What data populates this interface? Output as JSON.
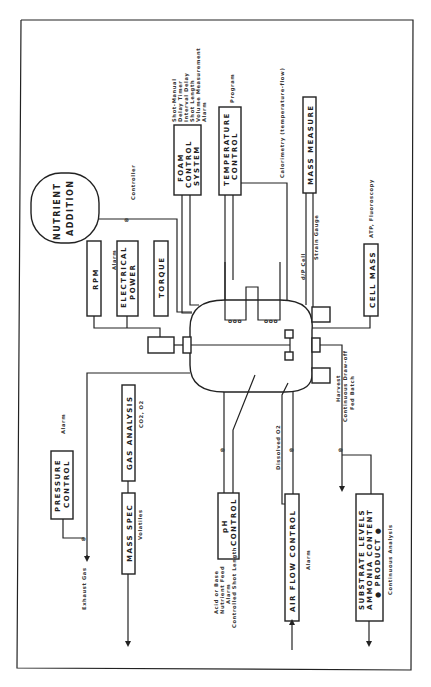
{
  "diagram": {
    "orientation": "rotated 90deg counter-clockwise",
    "blocks": {
      "nutrient": {
        "line1": "NUTRIENT",
        "line2": "ADDITION"
      },
      "foam": {
        "line1": "FOAM",
        "line2": "CONTROL",
        "line3": "SYSTEM"
      },
      "temperature": {
        "line1": "TEMPERATURE",
        "line2": "CONTROL"
      },
      "mass_measure": {
        "line1": "MASS MEASURE"
      },
      "rpm": {
        "line1": "RPM"
      },
      "electrical": {
        "line1": "ELECTRICAL",
        "line2": "POWER"
      },
      "torque": {
        "line1": "TORQUE"
      },
      "cell_mass": {
        "line1": "CELL MASS"
      },
      "pressure": {
        "line1": "PRESSURE",
        "line2": "CONTROL"
      },
      "gas_analysis": {
        "line1": "GAS ANALYSIS"
      },
      "mass_spec": {
        "line1": "MASS SPEC"
      },
      "ph": {
        "line1": "pH",
        "line2": "CONTROL"
      },
      "air_flow": {
        "line1": "AIR FLOW CONTROL"
      },
      "substrate": {
        "line1": "SUBSTRATE LEVELS",
        "line2": "AMMONIA CONTENT",
        "line3": "● PRODUCT ●"
      }
    },
    "annotations": {
      "controller": "Controller",
      "foam_notes": [
        "Shot-Manual",
        "Delay Timer",
        "Interval Delay",
        "Shot Length",
        "Volume Measurement",
        "Alarm"
      ],
      "program": "Program",
      "calorimetry": "Calorimetry (temperature-flow)",
      "atp": "ATP, Fluoroscopy",
      "dp_cell": "d/P Cell",
      "strain_gauge": "Strain Gauge",
      "alarm_elec": "Alarm",
      "alarm_pressure": "Alarm",
      "co2_o2": "CO2, O2",
      "volatiles": "Volatiles",
      "exhaust_gas": "Exhaust Gas",
      "ph_notes": [
        "Acid or Base",
        "Nutrient Feed",
        "Alarm",
        "Controlled Shot Length"
      ],
      "dissolved_o2": "Dissolved O2",
      "alarm_air": "Alarm",
      "harvest_notes": [
        "Harvest",
        "Continuous Draw-off",
        "Fed Batch"
      ],
      "continuous_analysis": "Continuous Analysis"
    }
  }
}
